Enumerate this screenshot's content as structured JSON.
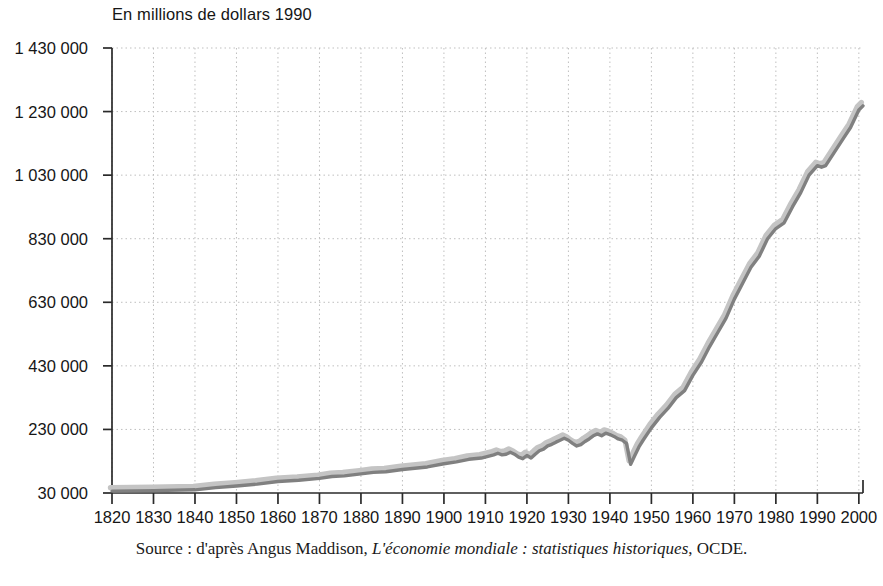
{
  "chart_data": {
    "type": "line",
    "title": "En millions de dollars 1990",
    "subtitle": "",
    "xlabel": "",
    "ylabel": "En millions de dollars 1990",
    "source": {
      "prefix": "Source : d'après Angus Maddison, ",
      "italic": "L'économie mondiale : statistiques historiques",
      "suffix": ", OCDE."
    },
    "grid": true,
    "legend_position": "none",
    "xlim": [
      1820,
      2001
    ],
    "ylim": [
      30000,
      1430000
    ],
    "yticks": [
      30000,
      230000,
      430000,
      630000,
      830000,
      1030000,
      1230000,
      1430000
    ],
    "ytick_labels": [
      "30 000",
      "230 000",
      "430 000",
      "630 000",
      "830 000",
      "1 030 000",
      "1 230 000",
      "1 430 000"
    ],
    "xticks": [
      1820,
      1830,
      1840,
      1850,
      1860,
      1870,
      1880,
      1890,
      1900,
      1910,
      1920,
      1930,
      1940,
      1950,
      1960,
      1970,
      1980,
      1990,
      2000
    ],
    "xtick_labels": [
      "1820",
      "1830",
      "1840",
      "1850",
      "1860",
      "1870",
      "1880",
      "1890",
      "1900",
      "1910",
      "1920",
      "1930",
      "1940",
      "1950",
      "1960",
      "1970",
      "1980",
      "1990",
      "2000"
    ],
    "series": [
      {
        "name": "PIB mondial",
        "color": "#808080",
        "shadow_color": "#c4c4c4",
        "x": [
          1820,
          1830,
          1840,
          1845,
          1850,
          1855,
          1860,
          1865,
          1870,
          1873,
          1876,
          1880,
          1883,
          1886,
          1890,
          1893,
          1896,
          1900,
          1903,
          1906,
          1909,
          1912,
          1913,
          1914,
          1915,
          1916,
          1917,
          1918,
          1919,
          1920,
          1921,
          1922,
          1923,
          1924,
          1925,
          1926,
          1927,
          1928,
          1929,
          1930,
          1931,
          1932,
          1933,
          1934,
          1935,
          1936,
          1937,
          1938,
          1939,
          1940,
          1941,
          1942,
          1943,
          1944,
          1945,
          1946,
          1947,
          1948,
          1950,
          1952,
          1954,
          1956,
          1958,
          1960,
          1962,
          1964,
          1966,
          1968,
          1970,
          1972,
          1974,
          1976,
          1978,
          1980,
          1982,
          1984,
          1986,
          1988,
          1990,
          1991,
          1992,
          1994,
          1996,
          1998,
          2000,
          2001
        ],
        "y": [
          36000,
          37500,
          40000,
          47000,
          52000,
          58000,
          66000,
          70000,
          76000,
          82000,
          84000,
          90000,
          95000,
          97000,
          104000,
          108000,
          112000,
          122000,
          128000,
          136000,
          140000,
          150000,
          155000,
          150000,
          152000,
          158000,
          152000,
          143000,
          138000,
          148000,
          140000,
          152000,
          163000,
          168000,
          178000,
          183000,
          190000,
          196000,
          202000,
          196000,
          186000,
          178000,
          182000,
          192000,
          200000,
          210000,
          216000,
          210000,
          218000,
          214000,
          208000,
          200000,
          196000,
          186000,
          120000,
          148000,
          175000,
          196000,
          235000,
          268000,
          296000,
          330000,
          352000,
          400000,
          440000,
          490000,
          535000,
          580000,
          640000,
          690000,
          740000,
          775000,
          830000,
          862000,
          880000,
          930000,
          975000,
          1030000,
          1060000,
          1055000,
          1060000,
          1100000,
          1140000,
          1180000,
          1235000,
          1248000
        ]
      }
    ]
  },
  "axes": {
    "title": "En millions de dollars 1990"
  }
}
